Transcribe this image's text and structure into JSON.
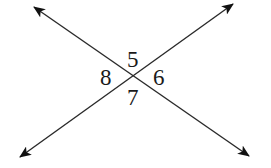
{
  "diagram": {
    "type": "intersecting-lines",
    "colors": {
      "line": "#2a2a2a",
      "arrowhead": "#111111",
      "label": "#1a1a1a",
      "background": "#ffffff"
    },
    "lines": [
      {
        "id": "line-a",
        "from": [
          34,
          7
        ],
        "to": [
          249,
          156
        ],
        "arrows": "both"
      },
      {
        "id": "line-b",
        "from": [
          20,
          157
        ],
        "to": [
          233,
          4
        ],
        "arrows": "both"
      }
    ],
    "intersection": [
      133,
      76
    ],
    "angles": [
      {
        "label": "5",
        "position": "top"
      },
      {
        "label": "6",
        "position": "right"
      },
      {
        "label": "7",
        "position": "bottom"
      },
      {
        "label": "8",
        "position": "left"
      }
    ]
  }
}
